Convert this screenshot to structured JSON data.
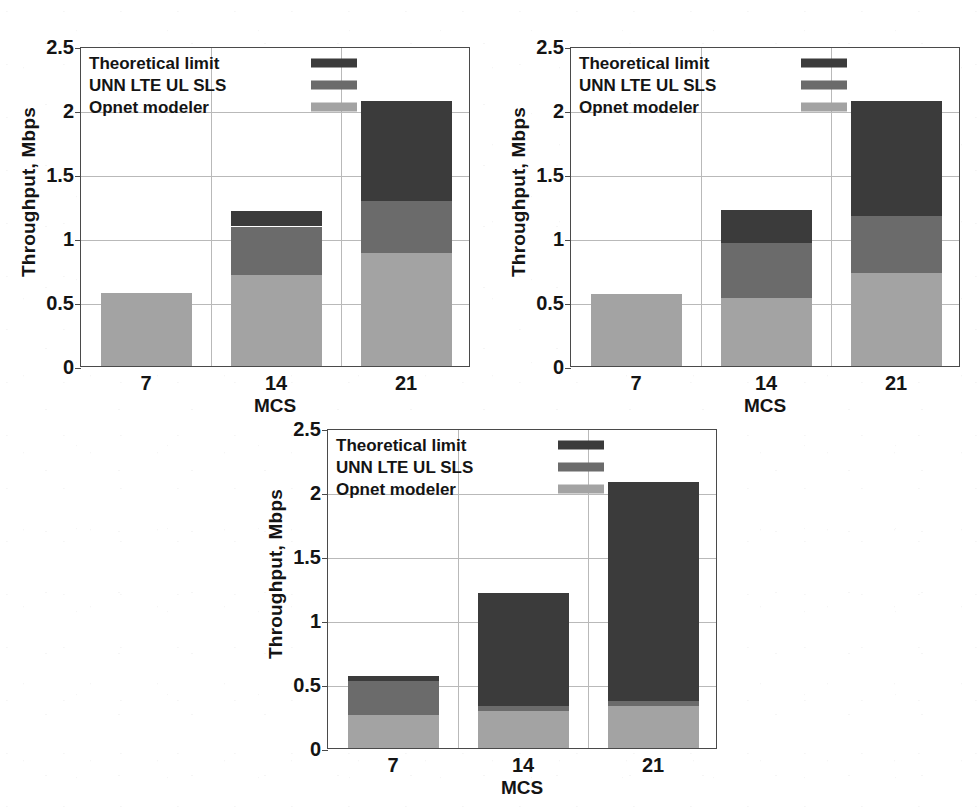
{
  "page": {
    "background": "#ffffff",
    "figure_count": 3
  },
  "palette": {
    "theoretical_limit": "#3b3b3b",
    "unn_lte_ul_sls": "#6b6b6b",
    "opnet_modeler": "#a3a3a3",
    "axis": "#4a4a4a",
    "grid": "#b9b9b9",
    "text": "#141414"
  },
  "legend": {
    "entries": [
      {
        "label": "Theoretical limit",
        "key": "theoretical",
        "color": "#3b3b3b"
      },
      {
        "label": "UNN LTE UL SLS",
        "key": "sls",
        "color": "#6b6b6b"
      },
      {
        "label": "Opnet modeler",
        "key": "opnet",
        "color": "#a3a3a3"
      }
    ]
  },
  "axes": {
    "ylabel": "Throughput, Mbps",
    "xlabel": "MCS",
    "yticks": [
      "0",
      "0.5",
      "1",
      "1.5",
      "2",
      "2.5"
    ],
    "ytick_values": [
      0,
      0.5,
      1,
      1.5,
      2,
      2.5
    ],
    "ylim": [
      0,
      2.5
    ],
    "xticks": [
      "7",
      "14",
      "21"
    ]
  },
  "chart_data": [
    {
      "id": "chart-1",
      "position": "top-left",
      "type": "bar",
      "stacked": true,
      "title": "",
      "xlabel": "MCS",
      "ylabel": "Throughput, Mbps",
      "ylim": [
        0,
        2.5
      ],
      "grid": true,
      "legend_position": "upper-left-inside",
      "categories": [
        "7",
        "14",
        "21"
      ],
      "series": [
        {
          "name": "Opnet modeler",
          "color": "#a3a3a3",
          "values": [
            0.57,
            0.71,
            0.88
          ]
        },
        {
          "name": "UNN LTE UL SLS",
          "color": "#6b6b6b",
          "values": [
            0.57,
            1.09,
            1.29
          ]
        },
        {
          "name": "Theoretical limit",
          "color": "#3b3b3b",
          "values": [
            0.57,
            1.21,
            2.07
          ]
        }
      ],
      "cumulative_tops": {
        "7": {
          "opnet": 0.57,
          "sls": 0.57,
          "theoretical": 0.57
        },
        "14": {
          "opnet": 0.71,
          "sls": 1.09,
          "theoretical": 1.21
        },
        "21": {
          "opnet": 0.88,
          "sls": 1.29,
          "theoretical": 2.07
        }
      }
    },
    {
      "id": "chart-2",
      "position": "top-right",
      "type": "bar",
      "stacked": true,
      "title": "",
      "xlabel": "MCS",
      "ylabel": "Throughput, Mbps",
      "ylim": [
        0,
        2.5
      ],
      "grid": true,
      "legend_position": "upper-left-inside",
      "categories": [
        "7",
        "14",
        "21"
      ],
      "series": [
        {
          "name": "Opnet modeler",
          "color": "#a3a3a3",
          "values": [
            0.56,
            0.53,
            0.73
          ]
        },
        {
          "name": "UNN LTE UL SLS",
          "color": "#6b6b6b",
          "values": [
            0.56,
            0.96,
            1.17
          ]
        },
        {
          "name": "Theoretical limit",
          "color": "#3b3b3b",
          "values": [
            0.56,
            1.22,
            2.07
          ]
        }
      ],
      "cumulative_tops": {
        "7": {
          "opnet": 0.56,
          "sls": 0.56,
          "theoretical": 0.56
        },
        "14": {
          "opnet": 0.53,
          "sls": 0.96,
          "theoretical": 1.22
        },
        "21": {
          "opnet": 0.73,
          "sls": 1.17,
          "theoretical": 2.07
        }
      }
    },
    {
      "id": "chart-3",
      "position": "bottom-center",
      "type": "bar",
      "stacked": true,
      "title": "",
      "xlabel": "MCS",
      "ylabel": "Throughput, Mbps",
      "ylim": [
        0,
        2.5
      ],
      "grid": true,
      "legend_position": "upper-left-inside",
      "categories": [
        "7",
        "14",
        "21"
      ],
      "series": [
        {
          "name": "Opnet modeler",
          "color": "#a3a3a3",
          "values": [
            0.26,
            0.29,
            0.33
          ]
        },
        {
          "name": "UNN LTE UL SLS",
          "color": "#6b6b6b",
          "values": [
            0.52,
            0.33,
            0.37
          ]
        },
        {
          "name": "Theoretical limit",
          "color": "#3b3b3b",
          "values": [
            0.56,
            1.21,
            2.08
          ]
        }
      ],
      "cumulative_tops": {
        "7": {
          "opnet": 0.26,
          "sls": 0.52,
          "theoretical": 0.56
        },
        "14": {
          "opnet": 0.29,
          "sls": 0.33,
          "theoretical": 1.21
        },
        "21": {
          "opnet": 0.33,
          "sls": 0.37,
          "theoretical": 2.08
        }
      }
    }
  ]
}
